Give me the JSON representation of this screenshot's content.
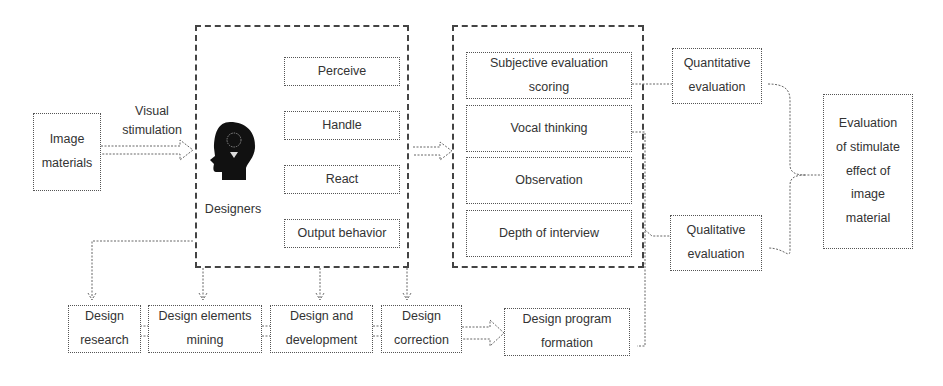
{
  "diagram": {
    "input": {
      "label": "Image materials"
    },
    "stimulus": {
      "label": "Visual stimulation"
    },
    "designers": {
      "label": "Designers",
      "icon": "head-lightbulb-icon",
      "stages": [
        "Perceive",
        "Handle",
        "React",
        "Output behavior"
      ]
    },
    "methods": [
      "Subjective evaluation scoring",
      "Vocal thinking",
      "Observation",
      "Depth of interview"
    ],
    "evaluations": {
      "quantitative": "Quantitative evaluation",
      "qualitative": "Qualitative evaluation"
    },
    "result": "Evaluation of stimulate effect of image material",
    "process": [
      "Design research",
      "Design elements mining",
      "Design and development",
      "Design correction"
    ],
    "formation": "Design program formation"
  }
}
